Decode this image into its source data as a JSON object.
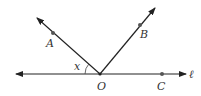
{
  "diagram": {
    "title": "",
    "line_label": "ℓ",
    "angle_label": "x",
    "points": {
      "A": {
        "label": "A",
        "x": 53,
        "y": 33,
        "lx": 46,
        "ly": 47
      },
      "B": {
        "label": "B",
        "x": 140,
        "y": 25,
        "lx": 140,
        "ly": 38
      },
      "O": {
        "label": "O",
        "x": 100,
        "y": 74,
        "lx": 97,
        "ly": 90
      },
      "C": {
        "label": "C",
        "x": 162,
        "y": 74,
        "lx": 157,
        "ly": 90
      }
    },
    "line": {
      "x1": 16,
      "y1": 74,
      "x2": 186,
      "y2": 74
    },
    "ray_OA": {
      "x1": 100,
      "y1": 74,
      "x2": 37,
      "y2": 18
    },
    "ray_OB": {
      "x1": 100,
      "y1": 74,
      "x2": 155,
      "y2": 8
    },
    "colors": {
      "stroke": "#222222",
      "point": "#555555",
      "text": "#333333"
    }
  }
}
